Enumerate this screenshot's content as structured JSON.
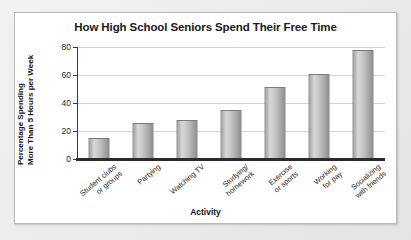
{
  "chart_data": {
    "type": "bar",
    "title": "How High School Seniors Spend Their Free Time",
    "xlabel": "Activity",
    "ylabel_line1": "Percentage Spending",
    "ylabel_line2": "More Than 5 Hours per Week",
    "categories": [
      "Student clubs\nor groups",
      "Partying",
      "Watching TV",
      "Studying/\nhomework",
      "Exercise\nor sports",
      "Working\nfor pay",
      "Socializing\nwith friends"
    ],
    "category_lines": [
      [
        "Student clubs",
        "or groups"
      ],
      [
        "Partying"
      ],
      [
        "Watching TV"
      ],
      [
        "Studying/",
        "homework"
      ],
      [
        "Exercise",
        "or sports"
      ],
      [
        "Working",
        "for pay"
      ],
      [
        "Socializing",
        "with friends"
      ]
    ],
    "values": [
      14,
      25,
      27,
      34,
      51,
      60,
      77
    ],
    "ylim": [
      0,
      80
    ],
    "yticks": [
      0,
      20,
      40,
      60,
      80
    ],
    "ytick_labels": [
      "0",
      "20",
      "40",
      "60",
      "80"
    ],
    "grid": true,
    "legend": false,
    "bar_color": "#c0c0c0",
    "axis_color": "#2b2b2b",
    "gridline_color": "#d2d2d2",
    "frame_background": "#ffffff",
    "page_background": "#eaeaea"
  }
}
